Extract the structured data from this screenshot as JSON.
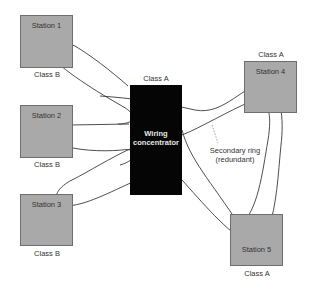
{
  "diagram": {
    "concentrator": {
      "label_line1": "Wiring",
      "label_line2": "concentrator",
      "class": "Class A"
    },
    "stations": [
      {
        "name": "Station 1",
        "class": "Class B"
      },
      {
        "name": "Station 2",
        "class": "Class B"
      },
      {
        "name": "Station 3",
        "class": "Class B"
      },
      {
        "name": "Station 4",
        "class": "Class A"
      },
      {
        "name": "Station 5",
        "class": "Class A"
      }
    ],
    "annotation": {
      "line1": "Secondary ring",
      "line2": "(redundant)"
    },
    "colors": {
      "station_fill": "#a9a9a9",
      "concentrator_fill": "#050505",
      "ring_line": "#333333"
    }
  }
}
